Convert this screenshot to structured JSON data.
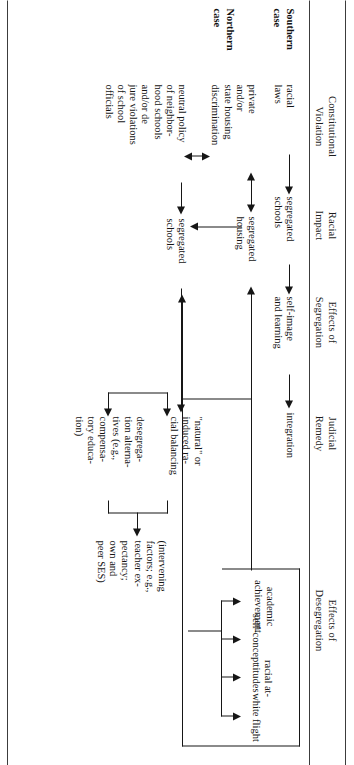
{
  "figure": {
    "orientation": "rotated-90-clockwise",
    "columns": [
      {
        "id": "constitutional-violation",
        "label": "Constitutional\nViolation"
      },
      {
        "id": "racial-impact",
        "label": "Racial\nImpact"
      },
      {
        "id": "effects-of-segregation",
        "label": "Effects of\nSegregation"
      },
      {
        "id": "judicial-remedy",
        "label": "Judicial\nRemedy"
      },
      {
        "id": "effects-of-desegregation",
        "label": "Effects of\nDesegregation"
      }
    ],
    "rows": [
      {
        "id": "southern-case",
        "label": "Southern\ncase"
      },
      {
        "id": "northern-case",
        "label": "Northern\ncase"
      }
    ],
    "nodes": {
      "racial_laws": "racial\nlaws",
      "segregated_schools_s": "segregated\nschools",
      "self_image": "self-image\nand learning",
      "integration": "integration",
      "private_state_housing": "private\nand/or\nstate housing\ndiscrimination",
      "segregated_housing": "segregated\nhousing",
      "neutral_policy": "neutral policy\nof neighbor-\nhood schools\nand/or de\njure violations\nof school\nofficials",
      "segregated_schools_n": "segregated\nschools",
      "racial_balancing": "\"natural\" or\ninduced ra-\ncial balancing",
      "desegregation_alts": "desegrega-\ntion alterna-\ntives (e.g.,\ncompensa-\ntory educa-\ntion)",
      "intervening_factors": "(intervening\nfactors; e.g.,\nteacher ex-\npectancy;\nown and\npeer SES)",
      "academic_achievement": "academic\nachievement",
      "self_concept": "self-concept",
      "racial_attitudes": "racial at-\ntitudes",
      "white_flight": "white flight"
    },
    "colors": {
      "ink": "#141414",
      "rule": "#3c3c3c",
      "background": "#ffffff"
    }
  }
}
